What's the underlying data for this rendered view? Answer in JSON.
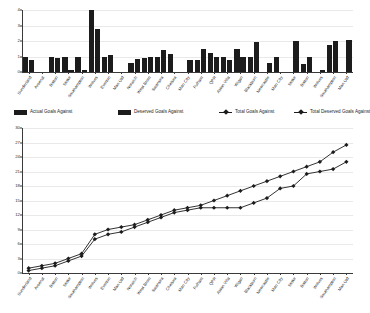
{
  "chart_data": [
    {
      "type": "bar",
      "title": "",
      "xlabel": "",
      "ylabel": "",
      "ylim": [
        0,
        4
      ],
      "yticks": [
        0,
        1,
        2,
        3,
        4
      ],
      "grid": true,
      "categories": [
        "Sunderland",
        "Arsenal",
        "Bolton",
        "Stoke",
        "Southampton",
        "Wolves",
        "Everton",
        "Man Utd",
        "Norwich",
        "West Brom",
        "Swansea",
        "Chelsea",
        "Man City",
        "Fulham",
        "QPR",
        "Aston Villa",
        "Wigan",
        "Blackburn",
        "Newcastle",
        "Man City",
        "Stoke",
        "Bolton",
        "Wolves",
        "Southampton",
        "Man Utd"
      ],
      "series": [
        {
          "name": "Actual Goals Against",
          "values": [
            1.0,
            0.0,
            1.0,
            0.95,
            1.0,
            4.0,
            1.0,
            0.0,
            0.6,
            0.9,
            0.95,
            1.15,
            0.0,
            0.8,
            1.25,
            1.0,
            1.5,
            1.0,
            0.0,
            1.0,
            0.0,
            0.5,
            0.0,
            1.75,
            0.0
          ]
        },
        {
          "name": "Deserved Goals Against",
          "values": [
            0.8,
            0.0,
            0.9,
            0.1,
            0.15,
            2.75,
            1.1,
            0.0,
            0.85,
            1.0,
            1.4,
            0.0,
            0.75,
            1.5,
            1.0,
            0.75,
            1.0,
            1.95,
            0.55,
            0.0,
            2.0,
            1.0,
            0.1,
            2.0,
            2.05
          ]
        }
      ]
    },
    {
      "type": "line",
      "title": "",
      "xlabel": "",
      "ylabel": "",
      "ylim": [
        0,
        30
      ],
      "yticks": [
        0,
        3,
        6,
        9,
        12,
        15,
        18,
        21,
        24,
        27,
        30
      ],
      "grid": true,
      "categories": [
        "Sunderland",
        "Arsenal",
        "Bolton",
        "Stoke",
        "Southampton",
        "Wolves",
        "Everton",
        "Man Utd",
        "Norwich",
        "West Brom",
        "Swansea",
        "Chelsea",
        "Man City",
        "Fulham",
        "QPR",
        "Aston Villa",
        "Wigan",
        "Blackburn",
        "Newcastle",
        "Man City",
        "Stoke",
        "Bolton",
        "Wolves",
        "Southampton",
        "Man Utd"
      ],
      "series": [
        {
          "name": "Total Goals Against",
          "values": [
            1.0,
            1.5,
            2.0,
            3.0,
            4.0,
            8.0,
            9.0,
            9.5,
            10.0,
            11.0,
            12.0,
            13.0,
            13.5,
            14.0,
            15.0,
            16.0,
            17.0,
            18.0,
            19.0,
            20.0,
            21.0,
            22.0,
            23.0,
            25.0,
            26.5
          ]
        },
        {
          "name": "Total Deserved Goals Against",
          "values": [
            0.5,
            1.0,
            1.5,
            2.5,
            3.5,
            7.0,
            8.0,
            8.5,
            9.5,
            10.5,
            11.5,
            12.5,
            13.0,
            13.5,
            13.5,
            13.5,
            13.5,
            14.5,
            15.5,
            17.5,
            18.0,
            20.5,
            21.0,
            21.5,
            23.0
          ]
        }
      ]
    }
  ],
  "legend": {
    "items": [
      {
        "label": "Actual Goals Against",
        "marker": "swatch-icon"
      },
      {
        "label": "Deserved Goals Against",
        "marker": "swatch-icon"
      },
      {
        "label": "Total Goals Against",
        "marker": "line-marker-icon"
      },
      {
        "label": "Total Deserved Goals Against",
        "marker": "line-marker-icon"
      }
    ]
  },
  "colors": {
    "series": "#1c1c1c",
    "grid": "#e9e9e9",
    "axis": "#3a3a3a"
  }
}
